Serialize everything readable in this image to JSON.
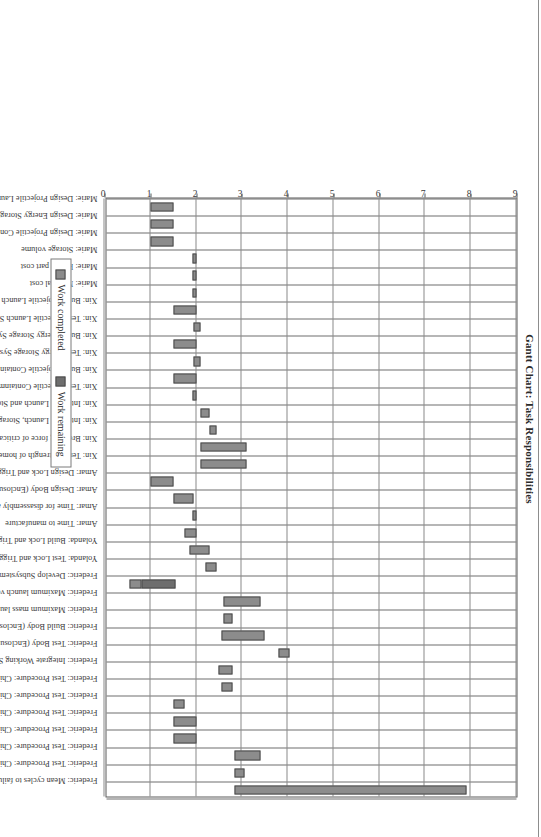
{
  "chart_data": {
    "type": "bar",
    "orientation": "gantt-vertical-rotated",
    "title": "Gantt Chart: Task Responsibilities",
    "xlabel": "",
    "ylabel": "",
    "ylim": [
      0,
      9
    ],
    "yticks": [
      "0",
      "1",
      "2",
      "3",
      "4",
      "5",
      "6",
      "7",
      "8",
      "9"
    ],
    "grid": true,
    "legend_position": "bottom",
    "series": [
      {
        "name": "Work completed",
        "color": "#8c8c8c"
      },
      {
        "name": "Work remaining",
        "color": "#6e6e6e"
      }
    ],
    "categories": [
      "Marie: Design Projectile Launch System",
      "Marie: Design Energy Storage System",
      "Marie: Design Projectile Containment System",
      "Marie: Storage volume",
      "Marie: Repair part cost",
      "Marie: Material cost",
      "Xin: Build Projectile Launch System",
      "Xin: Test Projectile Launch System",
      "Xin: Build Energy Storage System",
      "Xin: Test Energy Storage System",
      "Xin: Build Projectile Containment System",
      "Xin: Test Projectile Containment System",
      "Xin: Integrate Launch and Storage Systems",
      "Xin: Integrate Launch, Storage, and Containment Systems",
      "Xin: Breaking force of critical components",
      "Xin: Tensile strength of home-applied adhesive bond",
      "Amar: Design Lock and Trigger System",
      "Amar: Design Body (Enclosure System)",
      "Amar: Time for disassembly and reassembly",
      "Amar: Time to manufacture",
      "Yolanda: Build Lock and Trigger System",
      "Yolanda: Test Lock and Trigger System",
      "Frederic: Develop Subsystem Requirements",
      "Frederic: Maximum launch velocity",
      "Frederic: Maximum mass launch capability",
      "Frederic: Build Body (Enclosure System)",
      "Frederic: Test Body (Enclosure System)",
      "Frederic: Integrate Working System",
      "Frederic: Test Procedure: Child fails to arm toy",
      "Frederic: Test Procedure: Child releases armed toy near face of self or another child",
      "Frederic: Test Procedure: Child aims projectile at eyes of self or of another child",
      "Frederic: Test Procedure: Child plays with toy",
      "Frederic: Test Procedure: Child uses pet rodent as projectile",
      "Frederic: Test Procedure: Child drops or throws the toy",
      "Frederic: Mean cycles to failure"
    ],
    "bars": [
      {
        "category": "Marie: Design Projectile Launch System",
        "start": 1.0,
        "completed_end": 1.5,
        "end": 1.5
      },
      {
        "category": "Marie: Design Energy Storage System",
        "start": 1.0,
        "completed_end": 1.5,
        "end": 1.5
      },
      {
        "category": "Marie: Design Projectile Containment System",
        "start": 1.0,
        "completed_end": 1.5,
        "end": 1.5
      },
      {
        "category": "Marie: Storage volume",
        "start": 1.93,
        "completed_end": 2.0,
        "end": 2.0
      },
      {
        "category": "Marie: Repair part cost",
        "start": 1.93,
        "completed_end": 2.0,
        "end": 2.0
      },
      {
        "category": "Marie: Material cost",
        "start": 1.93,
        "completed_end": 2.0,
        "end": 2.0
      },
      {
        "category": "Xin: Build Projectile Launch System",
        "start": 1.5,
        "completed_end": 2.0,
        "end": 2.0
      },
      {
        "category": "Xin: Test Projectile Launch System",
        "start": 1.95,
        "completed_end": 2.1,
        "end": 2.1
      },
      {
        "category": "Xin: Build Energy Storage System",
        "start": 1.5,
        "completed_end": 2.0,
        "end": 2.0
      },
      {
        "category": "Xin: Test Energy Storage System",
        "start": 1.95,
        "completed_end": 2.1,
        "end": 2.1
      },
      {
        "category": "Xin: Build Projectile Containment System",
        "start": 1.5,
        "completed_end": 2.0,
        "end": 2.0
      },
      {
        "category": "Xin: Test Projectile Containment System",
        "start": 1.93,
        "completed_end": 2.0,
        "end": 2.0
      },
      {
        "category": "Xin: Integrate Launch and Storage Systems",
        "start": 2.1,
        "completed_end": 2.3,
        "end": 2.3
      },
      {
        "category": "Xin: Integrate Launch, Storage, and Containment Systems",
        "start": 2.3,
        "completed_end": 2.45,
        "end": 2.45
      },
      {
        "category": "Xin: Breaking force of critical components",
        "start": 2.1,
        "completed_end": 3.1,
        "end": 3.1
      },
      {
        "category": "Xin: Tensile strength of home-applied adhesive bond",
        "start": 2.1,
        "completed_end": 3.1,
        "end": 3.1
      },
      {
        "category": "Amar: Design Lock and Trigger System",
        "start": 1.0,
        "completed_end": 1.5,
        "end": 1.5
      },
      {
        "category": "Amar: Design Body (Enclosure System)",
        "start": 1.5,
        "completed_end": 1.95,
        "end": 1.95
      },
      {
        "category": "Amar: Time for disassembly and reassembly",
        "start": 1.93,
        "completed_end": 2.0,
        "end": 2.0
      },
      {
        "category": "Amar: Time to manufacture",
        "start": 1.75,
        "completed_end": 2.0,
        "end": 2.0
      },
      {
        "category": "Yolanda: Build Lock and Trigger System",
        "start": 1.85,
        "completed_end": 2.3,
        "end": 2.3
      },
      {
        "category": "Yolanda: Test Lock and Trigger System",
        "start": 2.2,
        "completed_end": 2.45,
        "end": 2.45
      },
      {
        "category": "Frederic: Develop Subsystem Requirements",
        "start": 0.55,
        "completed_end": 0.8,
        "end": 1.55
      },
      {
        "category": "Frederic: Maximum launch velocity",
        "start": 2.6,
        "completed_end": 3.4,
        "end": 3.4
      },
      {
        "category": "Frederic: Maximum mass launch capability",
        "start": 2.6,
        "completed_end": 2.8,
        "end": 2.8
      },
      {
        "category": "Frederic: Build Body (Enclosure System)",
        "start": 2.55,
        "completed_end": 3.5,
        "end": 3.5
      },
      {
        "category": "Frederic: Test Body (Enclosure System)",
        "start": 3.8,
        "completed_end": 4.05,
        "end": 4.05
      },
      {
        "category": "Frederic: Integrate Working System",
        "start": 2.5,
        "completed_end": 2.8,
        "end": 2.8
      },
      {
        "category": "Frederic: Test Procedure: Child fails to arm toy",
        "start": 2.55,
        "completed_end": 2.8,
        "end": 2.8
      },
      {
        "category": "Frederic: Test Procedure: Child releases armed toy near face of self or another child",
        "start": 1.5,
        "completed_end": 1.75,
        "end": 1.75
      },
      {
        "category": "Frederic: Test Procedure: Child aims projectile at eyes of self or of another child",
        "start": 1.5,
        "completed_end": 2.0,
        "end": 2.0
      },
      {
        "category": "Frederic: Test Procedure: Child plays with toy",
        "start": 1.5,
        "completed_end": 2.0,
        "end": 2.0
      },
      {
        "category": "Frederic: Test Procedure: Child uses pet rodent as projectile",
        "start": 2.85,
        "completed_end": 3.4,
        "end": 3.4
      },
      {
        "category": "Frederic: Test Procedure: Child drops or throws the toy",
        "start": 2.85,
        "completed_end": 3.05,
        "end": 3.05
      },
      {
        "category": "Frederic: Mean cycles to failure",
        "start": 2.85,
        "completed_end": 7.9,
        "end": 7.9
      }
    ]
  },
  "legend": {
    "items": [
      {
        "label": "Work completed"
      },
      {
        "label": "Work remaining"
      }
    ]
  }
}
